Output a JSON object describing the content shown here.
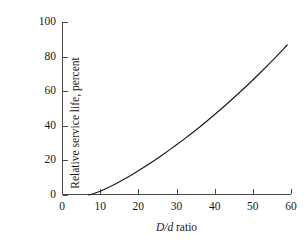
{
  "figure": {
    "background_color": "#ffffff",
    "axis_color": "#4a4a4a",
    "curve_color": "#1a1a1a"
  },
  "axes": {
    "xlabel_symbol": "D/d",
    "xlabel_suffix": " ratio",
    "xlabel_full": "D/d ratio",
    "ylabel": "Relative service life, percent",
    "xticks": [
      "0",
      "10",
      "20",
      "30",
      "40",
      "50",
      "60"
    ],
    "yticks": [
      "0",
      "20",
      "40",
      "60",
      "80",
      "100"
    ]
  },
  "chart_data": {
    "type": "line",
    "title": "",
    "xlabel": "D/d ratio",
    "ylabel": "Relative service life, percent",
    "xlim": [
      0,
      60
    ],
    "ylim": [
      0,
      100
    ],
    "xticks": [
      0,
      10,
      20,
      30,
      40,
      50,
      60
    ],
    "yticks": [
      0,
      20,
      40,
      60,
      80,
      100
    ],
    "grid": false,
    "legend": null,
    "series": [
      {
        "name": "Relative service life",
        "x": [
          7,
          8,
          10,
          12,
          14,
          16,
          18,
          20,
          22,
          24,
          26,
          28,
          30,
          32,
          34,
          36,
          38,
          40,
          42,
          44,
          46,
          48,
          50,
          52,
          54,
          56,
          58,
          59
        ],
        "y": [
          0,
          0.6,
          2.2,
          4.2,
          6.4,
          8.8,
          11.3,
          14.0,
          16.8,
          19.7,
          22.7,
          25.8,
          29.0,
          32.3,
          35.7,
          39.2,
          42.8,
          46.5,
          50.3,
          54.2,
          58.2,
          62.3,
          66.5,
          70.8,
          75.2,
          79.7,
          84.3,
          86.7
        ]
      }
    ]
  }
}
